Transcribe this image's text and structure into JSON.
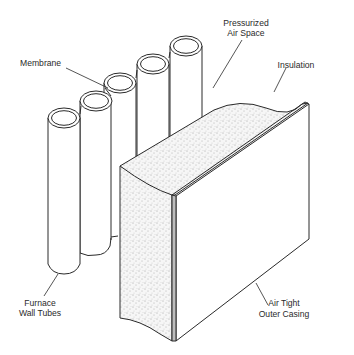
{
  "diagram": {
    "labels": {
      "membrane": "Membrane",
      "pressurized_line1": "Pressurized",
      "pressurized_line2": "Air Space",
      "insulation": "Insulation",
      "tubes_line1": "Furnace",
      "tubes_line2": "Wall Tubes",
      "casing_line1": "Air Tight",
      "casing_line2": "Outer Casing"
    },
    "components": [
      "Furnace Wall Tubes",
      "Membrane",
      "Pressurized Air Space",
      "Insulation",
      "Air Tight Outer Casing"
    ],
    "tube_count": 5,
    "colors": {
      "line": "#2a2a2a",
      "background": "#ffffff",
      "insulation_fill": "#f4f4f4"
    }
  }
}
